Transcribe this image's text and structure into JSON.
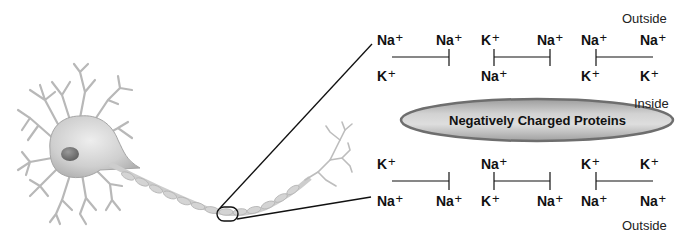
{
  "diagram": {
    "labels": {
      "outside_top": "Outside",
      "inside": "Inside",
      "outside_bottom": "Outside",
      "proteins": "Negatively Charged Proteins"
    },
    "colors": {
      "ellipse_fill_center": "#d6d6d6",
      "ellipse_fill_edge": "#9a9a9a",
      "ellipse_border": "#6e6e6e",
      "line": "#1a1a1a",
      "neuron": "#c8c8c8"
    },
    "top_row": {
      "upper_ions": [
        {
          "symbol": "Na",
          "charge": "+"
        },
        {
          "symbol": "Na",
          "charge": "+"
        },
        {
          "symbol": "K",
          "charge": "+"
        },
        {
          "symbol": "Na",
          "charge": "+"
        },
        {
          "symbol": "Na",
          "charge": "+"
        },
        {
          "symbol": "Na",
          "charge": "+"
        }
      ],
      "lower_ions": [
        {
          "symbol": "K",
          "charge": "+"
        },
        {
          "symbol": "Na",
          "charge": "+"
        },
        {
          "symbol": "K",
          "charge": "+"
        },
        {
          "symbol": "K",
          "charge": "+"
        }
      ]
    },
    "bottom_row": {
      "upper_ions": [
        {
          "symbol": "K",
          "charge": "+"
        },
        {
          "symbol": "Na",
          "charge": "+"
        },
        {
          "symbol": "K",
          "charge": "+"
        },
        {
          "symbol": "K",
          "charge": "+"
        }
      ],
      "lower_ions": [
        {
          "symbol": "Na",
          "charge": "+"
        },
        {
          "symbol": "Na",
          "charge": "+"
        },
        {
          "symbol": "K",
          "charge": "+"
        },
        {
          "symbol": "Na",
          "charge": "+"
        },
        {
          "symbol": "Na",
          "charge": "+"
        },
        {
          "symbol": "Na",
          "charge": "+"
        }
      ]
    }
  }
}
